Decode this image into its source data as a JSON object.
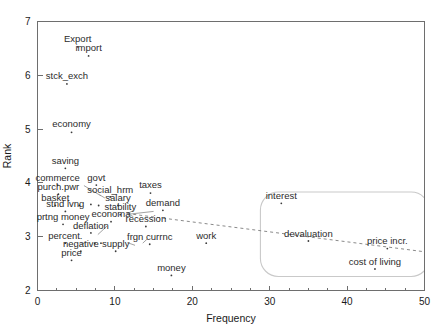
{
  "chart_data": {
    "type": "scatter",
    "title": "",
    "xlabel": "Frequency",
    "ylabel": "Rank",
    "xlim": [
      0,
      50
    ],
    "ylim": [
      2,
      7
    ],
    "xticks": [
      0,
      10,
      20,
      30,
      40,
      50
    ],
    "yticks": [
      2,
      3,
      4,
      5,
      6,
      7
    ],
    "xtick_labels": [
      "0",
      "10",
      "20",
      "30",
      "40",
      "50"
    ],
    "ytick_labels": [
      "2",
      "3",
      "4",
      "5",
      "6",
      "7"
    ],
    "minor_xtick_step": 2.5,
    "grid": false,
    "legend": "none",
    "points": [
      {
        "label": "Export",
        "x": 5.2,
        "y": 6.53,
        "lx": 5.2,
        "ly": 6.62,
        "anchor": "middle"
      },
      {
        "label": "import",
        "x": 6.6,
        "y": 6.36,
        "lx": 6.6,
        "ly": 6.45,
        "anchor": "middle"
      },
      {
        "label": "stck_exch",
        "x": 3.8,
        "y": 5.84,
        "lx": 3.8,
        "ly": 5.93,
        "anchor": "middle"
      },
      {
        "label": "economy",
        "x": 4.4,
        "y": 4.94,
        "lx": 4.4,
        "ly": 5.03,
        "anchor": "middle"
      },
      {
        "label": "saving",
        "x": 3.6,
        "y": 4.27,
        "lx": 3.6,
        "ly": 4.36,
        "anchor": "middle"
      },
      {
        "label": "commerce",
        "x": 2.6,
        "y": 3.96,
        "lx": 2.6,
        "ly": 4.04,
        "anchor": "middle"
      },
      {
        "label": "govt",
        "x": 7.6,
        "y": 3.96,
        "lx": 7.6,
        "ly": 4.04,
        "anchor": "middle"
      },
      {
        "label": "taxes",
        "x": 14.6,
        "y": 3.81,
        "lx": 14.6,
        "ly": 3.9,
        "anchor": "middle"
      },
      {
        "label": "purch.pwr",
        "x": 2.7,
        "y": 3.79,
        "lx": 2.7,
        "ly": 3.87,
        "anchor": "middle"
      },
      {
        "label": "social_hrm",
        "x": 9.4,
        "y": 3.74,
        "lx": 9.4,
        "ly": 3.82,
        "anchor": "middle"
      },
      {
        "label": "basket",
        "x": 2.3,
        "y": 3.58,
        "lx": 2.3,
        "ly": 3.66,
        "anchor": "middle"
      },
      {
        "label": "salary",
        "x": 10.4,
        "y": 3.58,
        "lx": 10.4,
        "ly": 3.66,
        "anchor": "middle"
      },
      {
        "label": "demand",
        "x": 16.2,
        "y": 3.49,
        "lx": 16.2,
        "ly": 3.57,
        "anchor": "middle"
      },
      {
        "label": "stnd lvng",
        "x": 3.6,
        "y": 3.47,
        "lx": 3.6,
        "ly": 3.55,
        "anchor": "middle"
      },
      {
        "label": "stability",
        "x": 10.7,
        "y": 3.41,
        "lx": 10.7,
        "ly": 3.49,
        "anchor": "middle"
      },
      {
        "label": "economa",
        "x": 9.5,
        "y": 3.28,
        "lx": 9.5,
        "ly": 3.36,
        "anchor": "middle"
      },
      {
        "label": "prtng money",
        "x": 3.3,
        "y": 3.23,
        "lx": 3.3,
        "ly": 3.31,
        "anchor": "middle"
      },
      {
        "label": "recession",
        "x": 14.0,
        "y": 3.19,
        "lx": 14.0,
        "ly": 3.27,
        "anchor": "middle"
      },
      {
        "label": "deflation",
        "x": 6.9,
        "y": 3.07,
        "lx": 6.9,
        "ly": 3.15,
        "anchor": "middle"
      },
      {
        "label": "work",
        "x": 21.8,
        "y": 2.88,
        "lx": 21.8,
        "ly": 2.96,
        "anchor": "middle"
      },
      {
        "label": "percent.",
        "x": 3.6,
        "y": 2.88,
        "lx": 3.6,
        "ly": 2.96,
        "anchor": "middle"
      },
      {
        "label": "frgn currnc",
        "x": 14.5,
        "y": 2.86,
        "lx": 14.5,
        "ly": 2.94,
        "anchor": "middle"
      },
      {
        "label": "negative",
        "x": 5.6,
        "y": 2.73,
        "lx": 5.6,
        "ly": 2.81,
        "anchor": "middle"
      },
      {
        "label": "supply",
        "x": 10.1,
        "y": 2.73,
        "lx": 10.1,
        "ly": 2.81,
        "anchor": "middle"
      },
      {
        "label": "price",
        "x": 4.4,
        "y": 2.56,
        "lx": 4.4,
        "ly": 2.64,
        "anchor": "middle"
      },
      {
        "label": "money",
        "x": 17.3,
        "y": 2.28,
        "lx": 17.3,
        "ly": 2.36,
        "anchor": "middle"
      },
      {
        "label": "interest",
        "x": 31.5,
        "y": 3.62,
        "lx": 31.5,
        "ly": 3.7,
        "anchor": "middle"
      },
      {
        "label": "devaluation",
        "x": 35.0,
        "y": 2.92,
        "lx": 35.0,
        "ly": 3.0,
        "anchor": "middle"
      },
      {
        "label": "price incr.",
        "x": 45.2,
        "y": 2.78,
        "lx": 45.2,
        "ly": 2.86,
        "anchor": "middle"
      },
      {
        "label": "cost of living",
        "x": 43.6,
        "y": 2.4,
        "lx": 43.6,
        "ly": 2.48,
        "anchor": "middle"
      }
    ],
    "unlabeled_points": [
      {
        "x": 5.4,
        "y": 3.58
      },
      {
        "x": 6.9,
        "y": 3.6
      },
      {
        "x": 7.9,
        "y": 3.58
      },
      {
        "x": 7.4,
        "y": 2.88
      },
      {
        "x": 8.2,
        "y": 2.88
      }
    ],
    "trend_line": {
      "x0": 11.6,
      "y0": 3.43,
      "x1": 50.0,
      "y1": 2.72
    },
    "cluster_region": {
      "label": "rounded-highlight-region",
      "x0": 28.8,
      "y0": 2.26,
      "x1": 50.6,
      "y1": 3.83,
      "corner_radius_px": 18
    },
    "leader_lines": [
      {
        "x0": 15.0,
        "y0": 3.47,
        "x1": 11.9,
        "y1": 3.42
      },
      {
        "x0": 6.0,
        "y0": 3.95,
        "x1": 8.2,
        "y1": 3.76
      },
      {
        "x0": 8.7,
        "y0": 3.72,
        "x1": 8.0,
        "y1": 3.78
      },
      {
        "x0": 7.8,
        "y0": 3.04,
        "x1": 9.0,
        "y1": 3.2
      },
      {
        "x0": 5.6,
        "y0": 2.86,
        "x1": 6.4,
        "y1": 2.9
      },
      {
        "x0": 12.6,
        "y0": 2.84,
        "x1": 11.6,
        "y1": 2.89
      },
      {
        "x0": 14.2,
        "y0": 2.96,
        "x1": 13.6,
        "y1": 2.88
      }
    ]
  },
  "axes": {
    "x_title": "Frequency",
    "y_title": "Rank"
  },
  "colors": {
    "frame": "#6e6e6e",
    "point": "#3b3b3b",
    "text": "#1a1a1a",
    "trend": "#8a8a8a",
    "region_border": "#c9c9c9",
    "background": "#ffffff"
  }
}
